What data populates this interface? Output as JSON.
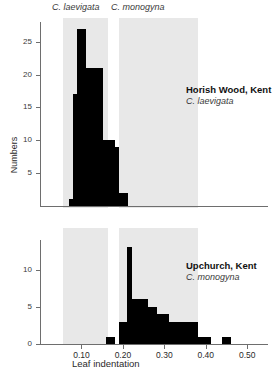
{
  "headers": {
    "left": "C. laevigata",
    "right": "C. monogyna"
  },
  "axes": {
    "x_title": "Leaf indentation",
    "y_title": "Numbers",
    "x_ticks": [
      "0.10",
      "0.20",
      "0.30",
      "0.40",
      "0.50"
    ],
    "y_ticks_top": [
      "5",
      "10",
      "15",
      "20",
      "25"
    ],
    "y_ticks_bottom": [
      "0",
      "5",
      "10"
    ],
    "zero_top": "0"
  },
  "annotations": {
    "top": {
      "site": "Horish Wood, Kent",
      "species": "C. laevigata"
    },
    "bottom": {
      "site": "Upchurch, Kent",
      "species": "C. monogyna"
    }
  },
  "colors": {
    "bar": "#000000",
    "band": "#e8e8e8",
    "axis": "#6e6e6e",
    "background": "#ffffff",
    "text": "#1a1a1a"
  },
  "chart_data": {
    "type": "bar",
    "xlabel": "Leaf indentation",
    "ylabel": "Numbers",
    "grid": false,
    "legend": "none",
    "xlim": [
      0.0,
      0.55
    ],
    "bin_width": 0.01,
    "reference_bands": [
      {
        "label": "C. laevigata",
        "x_start": 0.055,
        "x_end": 0.165
      },
      {
        "label": "C. monogyna",
        "x_start": 0.19,
        "x_end": 0.38
      }
    ],
    "panels": [
      {
        "name": "Horish Wood, Kent",
        "species": "C. laevigata",
        "ylim": [
          0,
          28
        ],
        "yticks": [
          5,
          10,
          15,
          20,
          25
        ],
        "x": [
          0.06,
          0.07,
          0.08,
          0.09,
          0.1,
          0.11,
          0.12,
          0.13,
          0.14,
          0.15,
          0.16,
          0.17,
          0.18,
          0.19,
          0.2,
          0.21
        ],
        "values": [
          0,
          1,
          17,
          27,
          27,
          21,
          21,
          21,
          21,
          10,
          10,
          10,
          9,
          2,
          2,
          0
        ]
      },
      {
        "name": "Upchurch, Kent",
        "species": "C. monogyna",
        "ylim": [
          0,
          14
        ],
        "yticks": [
          0,
          5,
          10
        ],
        "x": [
          0.16,
          0.17,
          0.18,
          0.19,
          0.2,
          0.21,
          0.22,
          0.23,
          0.24,
          0.25,
          0.26,
          0.27,
          0.28,
          0.29,
          0.3,
          0.31,
          0.32,
          0.33,
          0.34,
          0.35,
          0.36,
          0.37,
          0.38,
          0.39,
          0.4,
          0.41,
          0.42,
          0.43,
          0.44,
          0.45,
          0.46,
          0.47
        ],
        "values": [
          1,
          1,
          0,
          3,
          3,
          13,
          6,
          6,
          6,
          6,
          5,
          5,
          4,
          4,
          4,
          3,
          3,
          3,
          3,
          3,
          3,
          3,
          1,
          1,
          1,
          0,
          0,
          0,
          1,
          1,
          0,
          0
        ]
      }
    ]
  }
}
